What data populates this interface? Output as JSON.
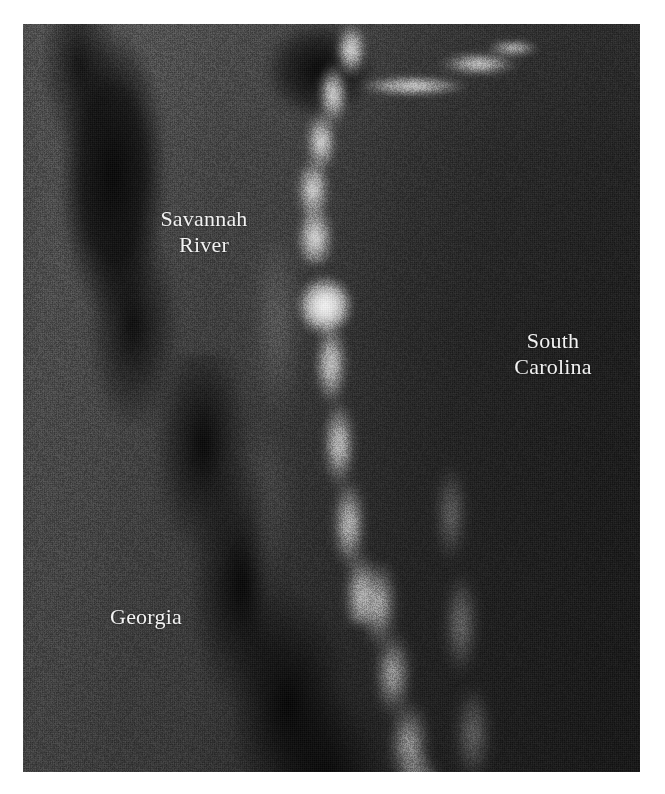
{
  "figure": {
    "kind": "grayscale-satellite-image",
    "plate": {
      "left": 23,
      "top": 24,
      "width": 617,
      "height": 748,
      "border_color": "#ffffff",
      "background_color": "#2e2e2e"
    }
  },
  "labels": {
    "savannah_river": "Savannah\nRiver",
    "south_carolina": "South\nCarolina",
    "georgia": "Georgia"
  },
  "label_style": {
    "text_color": "#f2f2f2",
    "font_size_px": 22,
    "alignment": "center"
  },
  "palette": {
    "page_background": "#ffffff",
    "land_light_grey": "#3a3a3a",
    "land_mid_grey": "#2c2c2c",
    "land_dark_grey": "#191919",
    "forest_black": "#000000",
    "river_white": "#ffffff"
  },
  "features": [
    {
      "name": "savannah-river-channel",
      "tone": "bright",
      "description": "Bright meandering channel entering top-centre, bending south-west then running south and curving south-east toward the bottom edge"
    },
    {
      "name": "tributary-streak",
      "tone": "bright",
      "description": "Short bright horizontal streak joining the main channel from the upper right"
    },
    {
      "name": "confluence-hotspot",
      "tone": "brightest",
      "description": "Saturated white return just below the river bend"
    },
    {
      "name": "georgia-forest-band",
      "tone": "dark",
      "description": "Mottled very dark diagonal band of forest on the Georgia side, running from the upper left down to the lower centre"
    },
    {
      "name": "south-carolina-uplands",
      "tone": "dark",
      "description": "Broad uniformly dark terrain filling the right half of the scene"
    }
  ]
}
